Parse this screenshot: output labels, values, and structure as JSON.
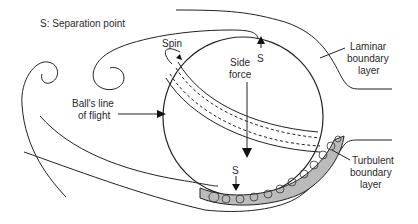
{
  "diagram": {
    "legend": "S: Separation point",
    "labels": {
      "spin": "Spin",
      "side_force_line1": "Side",
      "side_force_line2": "force",
      "separation_top": "S",
      "separation_bottom": "S",
      "flight_line1": "Ball's line",
      "flight_line2": "of flight",
      "laminar_line1": "Laminar",
      "laminar_line2": "boundary",
      "laminar_line3": "layer",
      "turbulent_line1": "Turbulent",
      "turbulent_line2": "boundary",
      "turbulent_line3": "layer"
    },
    "colors": {
      "background": "#ffffff",
      "stroke": "#222222",
      "text": "#2a2a2a"
    }
  }
}
